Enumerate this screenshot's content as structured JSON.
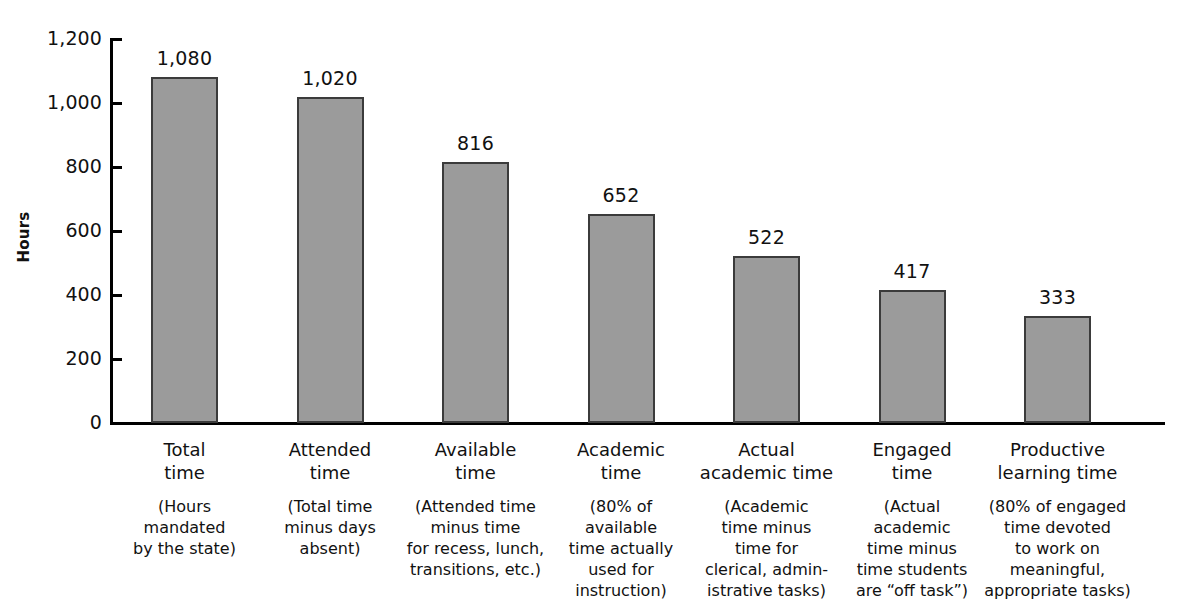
{
  "chart_data": {
    "type": "bar",
    "title": "",
    "xlabel": "",
    "ylabel": "Hours",
    "ylim": [
      0,
      1200
    ],
    "ytick_values": [
      1200,
      1000,
      800,
      600,
      400,
      200,
      0
    ],
    "ytick_labels": [
      "1,200",
      "1,000",
      "800",
      "600",
      "400",
      "200",
      "0"
    ],
    "grid": false,
    "legend": "none",
    "bar_color": "#9b9b9b",
    "bar_edge_color": "#3b3b3b",
    "background": "#ffffff",
    "categories": [
      "Total\ntime",
      "Attended\ntime",
      "Available\ntime",
      "Academic\ntime",
      "Actual\nacademic time",
      "Engaged\ntime",
      "Productive\nlearning time"
    ],
    "category_descriptions": [
      "(Hours\nmandated\nby the state)",
      "(Total time\nminus days\nabsent)",
      "(Attended time\nminus time\nfor recess, lunch,\ntransitions, etc.)",
      "(80% of\navailable\ntime actually\nused for\ninstruction)",
      "(Academic\ntime minus\ntime for\nclerical, admin-\nistrative tasks)",
      "(Actual\nacademic\ntime minus\ntime students\nare “off task”)",
      "(80% of engaged\ntime devoted\nto work on\nmeaningful,\nappropriate tasks)"
    ],
    "values": [
      1080,
      1020,
      816,
      652,
      522,
      417,
      333
    ],
    "value_labels": [
      "1,080",
      "1,020",
      "816",
      "652",
      "522",
      "417",
      "333"
    ]
  }
}
